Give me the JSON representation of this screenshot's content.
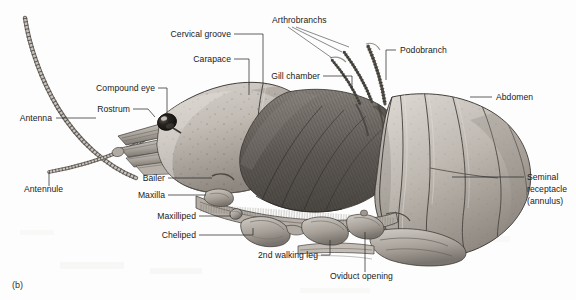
{
  "figure": {
    "panel_label": "(b)",
    "background_color": "#fdfdfd",
    "ink_color": "#2b2b2b"
  },
  "palette": {
    "carapace_light": "#cfcac4",
    "carapace_mid": "#a9a29b",
    "carapace_dark": "#6f6a65",
    "gill_dark": "#4a4641",
    "gill_mid": "#706b66",
    "abdomen_light": "#d6d1cb",
    "abdomen_mid": "#aaa49d",
    "outline": "#3a3632",
    "eye": "#171513",
    "eye_highlight": "#e8e6e3"
  },
  "labels": [
    {
      "id": "antenna",
      "text": "Antenna",
      "align": "end",
      "text_x": 52,
      "text_y": 121,
      "leader": "M56,118 L96,118"
    },
    {
      "id": "antennule",
      "text": "Antennule",
      "align": "start",
      "text_x": 24,
      "text_y": 192,
      "leader": "M49,186 L49,172"
    },
    {
      "id": "rostrum",
      "text": "Rostrum",
      "align": "end",
      "text_x": 130,
      "text_y": 112,
      "leader": "M133,109 L148,109 L155,117"
    },
    {
      "id": "compound-eye",
      "text": "Compound eye",
      "align": "end",
      "text_x": 155,
      "text_y": 91,
      "leader": "M158,88 L167,88 L167,115"
    },
    {
      "id": "carapace",
      "text": "Carapace",
      "align": "end",
      "text_x": 231,
      "text_y": 62,
      "leader": "M234,59 L249,59 L249,95"
    },
    {
      "id": "cervical-groove",
      "text": "Cervical groove",
      "align": "end",
      "text_x": 231,
      "text_y": 37,
      "leader": "M234,34 L263,34 L263,84"
    },
    {
      "id": "arthrobranchs",
      "text": "Arthrobranchs",
      "align": "start",
      "text_x": 272,
      "text_y": 23,
      "leader": "M288,27 L332,58 M292,27 L342,52 M296,27 L349,47"
    },
    {
      "id": "gill-chamber",
      "text": "Gill chamber",
      "align": "end",
      "text_x": 320,
      "text_y": 79,
      "leader": "M323,76 L352,76 L352,90"
    },
    {
      "id": "podobranch",
      "text": "Podobranch",
      "align": "start",
      "text_x": 400,
      "text_y": 53,
      "leader": "M396,50 L386,50 L386,80"
    },
    {
      "id": "abdomen",
      "text": "Abdomen",
      "align": "start",
      "text_x": 496,
      "text_y": 100,
      "leader": "M492,97 L470,97"
    },
    {
      "id": "seminal-receptacle",
      "text": "Seminal",
      "text_line_2": "receptacle",
      "text_line_3": "(annulus)",
      "align": "start",
      "text_x": 527,
      "text_y": 180,
      "leader": "M524,177 L452,177"
    },
    {
      "id": "bailer",
      "text": "Bailer",
      "align": "end",
      "text_x": 165,
      "text_y": 181,
      "leader": "M168,178 L212,178"
    },
    {
      "id": "maxilla",
      "text": "Maxilla",
      "align": "end",
      "text_x": 165,
      "text_y": 198,
      "leader": "M168,195 L206,195"
    },
    {
      "id": "maxilliped",
      "text": "Maxilliped",
      "align": "end",
      "text_x": 196,
      "text_y": 219,
      "leader": "M199,216 L231,216"
    },
    {
      "id": "cheliped",
      "text": "Cheliped",
      "align": "end",
      "text_x": 196,
      "text_y": 238,
      "leader": "M199,235 L253,235 L253,228"
    },
    {
      "id": "second-walking-leg",
      "text": "2nd walking leg",
      "align": "end",
      "text_x": 318,
      "text_y": 258,
      "leader": "M321,255 L330,255 L330,240"
    },
    {
      "id": "oviduct-opening",
      "text": "Oviduct opening",
      "align": "start",
      "text_x": 330,
      "text_y": 279,
      "leader": "M365,272 L365,232"
    }
  ]
}
